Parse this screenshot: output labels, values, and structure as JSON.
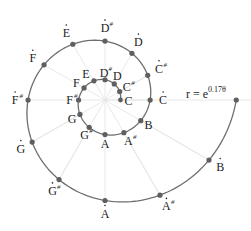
{
  "diagram": {
    "formula": {
      "base": "r = e",
      "exponent": "0.17θ"
    },
    "center": [
      105,
      100
    ],
    "growth": 0.17,
    "r0": 15.5,
    "colors": {
      "spiral": "#6e6e6e",
      "dot": "#5f5f5f",
      "spoke": "#e2e2e2",
      "text": "#222222",
      "chord": "#e6e6e6"
    },
    "inner_loop": [
      {
        "note": "C",
        "sharp": false,
        "dot": false
      },
      {
        "note": "C",
        "sharp": true,
        "dot": false
      },
      {
        "note": "D",
        "sharp": false,
        "dot": false
      },
      {
        "note": "D",
        "sharp": true,
        "dot": false
      },
      {
        "note": "E",
        "sharp": false,
        "dot": false
      },
      {
        "note": "F",
        "sharp": false,
        "dot": false
      },
      {
        "note": "F",
        "sharp": true,
        "dot": false
      },
      {
        "note": "G",
        "sharp": false,
        "dot": false
      },
      {
        "note": "G",
        "sharp": true,
        "dot": false
      },
      {
        "note": "A",
        "sharp": false,
        "dot": false
      },
      {
        "note": "A",
        "sharp": true,
        "dot": false
      },
      {
        "note": "B",
        "sharp": false,
        "dot": false
      }
    ],
    "outer_loop": [
      {
        "note": "C",
        "sharp": false,
        "dot": true
      },
      {
        "note": "C",
        "sharp": true,
        "dot": true
      },
      {
        "note": "D",
        "sharp": false,
        "dot": true
      },
      {
        "note": "D",
        "sharp": true,
        "dot": true
      },
      {
        "note": "E",
        "sharp": false,
        "dot": true
      },
      {
        "note": "F",
        "sharp": false,
        "dot": true
      },
      {
        "note": "F",
        "sharp": true,
        "dot": true
      },
      {
        "note": "G",
        "sharp": false,
        "dot": true
      },
      {
        "note": "G",
        "sharp": true,
        "dot": true
      },
      {
        "note": "A",
        "sharp": false,
        "dot": true
      },
      {
        "note": "A",
        "sharp": true,
        "dot": true
      },
      {
        "note": "B",
        "sharp": false,
        "dot": true
      }
    ]
  }
}
